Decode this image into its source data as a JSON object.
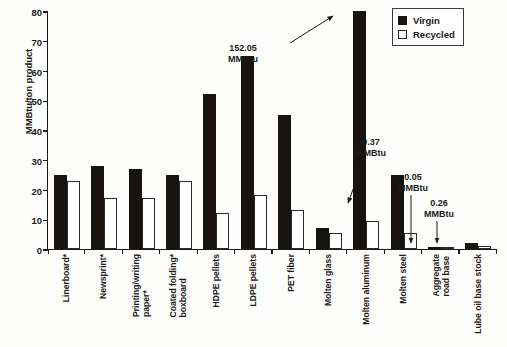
{
  "chart_data": {
    "type": "bar",
    "title": "",
    "xlabel": "",
    "ylabel": "MMBtu/ton product",
    "ylim": [
      0,
      80
    ],
    "yticks": [
      0,
      10,
      20,
      30,
      40,
      50,
      60,
      70,
      80
    ],
    "grid": false,
    "legend_position": "top-right",
    "categories": [
      "Linerboard*",
      "Newsprint*",
      "Printing/writing paper*",
      "Coated folding boxboard*",
      "HDPE pellets",
      "LDPE pellets",
      "PET fiber",
      "Molten glass",
      "Molten aluminum",
      "Molten steel",
      "Aggregate road base",
      "Lube oil base stock"
    ],
    "series": [
      {
        "name": "Virgin",
        "color": "#161310",
        "values": [
          25,
          28,
          27,
          25,
          52,
          65,
          45,
          7,
          80,
          25,
          0.05,
          2
        ]
      },
      {
        "name": "Recycled",
        "color": "#ffffff",
        "values": [
          23,
          17,
          17,
          23,
          12,
          18,
          13,
          5.5,
          9.37,
          5.5,
          0.26,
          1
        ]
      }
    ],
    "annotations": [
      {
        "id": "molten-aluminum-virgin",
        "value_line1": "152.05",
        "value_line2": "MMBtu",
        "target_series": "Virgin",
        "target_category": "Molten aluminum",
        "note": "bar exceeds axis maximum"
      },
      {
        "id": "molten-aluminum-recycled",
        "value_line1": "9.37",
        "value_line2": "MMBtu",
        "target_series": "Recycled",
        "target_category": "Molten aluminum"
      },
      {
        "id": "aggregate-road-base-virgin",
        "value_line1": "0.05",
        "value_line2": "MMBtu",
        "target_series": "Virgin",
        "target_category": "Aggregate road base"
      },
      {
        "id": "aggregate-road-base-recycled",
        "value_line1": "0.26",
        "value_line2": "MMBtu",
        "target_series": "Recycled",
        "target_category": "Aggregate road base"
      }
    ]
  },
  "axis": {
    "y_title": "MMBtu/ton product",
    "y_tick_labels": [
      "80",
      "70",
      "60",
      "50",
      "40",
      "30",
      "20",
      "10",
      "0"
    ]
  },
  "legend": {
    "items": [
      {
        "label": "Virgin",
        "swatch": "filled-square"
      },
      {
        "label": "Recycled",
        "swatch": "outlined-square"
      }
    ]
  },
  "x_axis_labels": [
    {
      "line1": "Linerboard*",
      "line2": ""
    },
    {
      "line1": "Newsprint*",
      "line2": ""
    },
    {
      "line1": "Printing/writing",
      "line2": "paper*"
    },
    {
      "line1": "Coated folding*",
      "line2": "boxboard"
    },
    {
      "line1": "HDPE pellets",
      "line2": ""
    },
    {
      "line1": "LDPE pellets",
      "line2": ""
    },
    {
      "line1": "PET fiber",
      "line2": ""
    },
    {
      "line1": "Molten glass",
      "line2": ""
    },
    {
      "line1": "Molten aluminum",
      "line2": ""
    },
    {
      "line1": "Molten steel",
      "line2": ""
    },
    {
      "line1": "Aggregate",
      "line2": "road base"
    },
    {
      "line1": "Lube oil base stock",
      "line2": ""
    }
  ]
}
